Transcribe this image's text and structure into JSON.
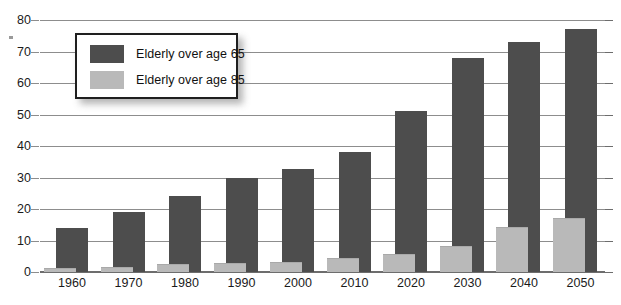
{
  "chart_data": {
    "type": "bar",
    "title": "",
    "subtitle": "",
    "xlabel": "",
    "ylabel": "",
    "ylim": [
      0,
      80
    ],
    "ytick_step": 10,
    "yticks": [
      0,
      10,
      20,
      30,
      40,
      50,
      60,
      70,
      80
    ],
    "grid": true,
    "legend_position": "top-left-inside",
    "categories": [
      "1960",
      "1970",
      "1980",
      "1990",
      "2000",
      "2010",
      "2020",
      "2030",
      "2040",
      "2050"
    ],
    "series": [
      {
        "name": "Elderly over age 65",
        "color": "#4d4d4d",
        "values": [
          14,
          19,
          24,
          30,
          32.7,
          38,
          51,
          68,
          73,
          77
        ]
      },
      {
        "name": "Elderly over age 85",
        "color": "#b9b9b9",
        "values": [
          1.2,
          1.7,
          2.4,
          2.9,
          3.2,
          4.5,
          5.7,
          8.4,
          14.2,
          17
        ]
      }
    ]
  },
  "legend": {
    "entries": [
      {
        "label": "Elderly over age 65",
        "swatch": "#4d4d4d"
      },
      {
        "label": "Elderly over age 85",
        "swatch": "#b9b9b9"
      }
    ]
  },
  "axes": {
    "y_tick_labels": [
      "0",
      "10",
      "20",
      "30",
      "40",
      "50",
      "60",
      "70",
      "80"
    ],
    "x_tick_labels": [
      "1960",
      "1970",
      "1980",
      "1990",
      "2000",
      "2010",
      "2020",
      "2030",
      "2040",
      "2050"
    ]
  }
}
